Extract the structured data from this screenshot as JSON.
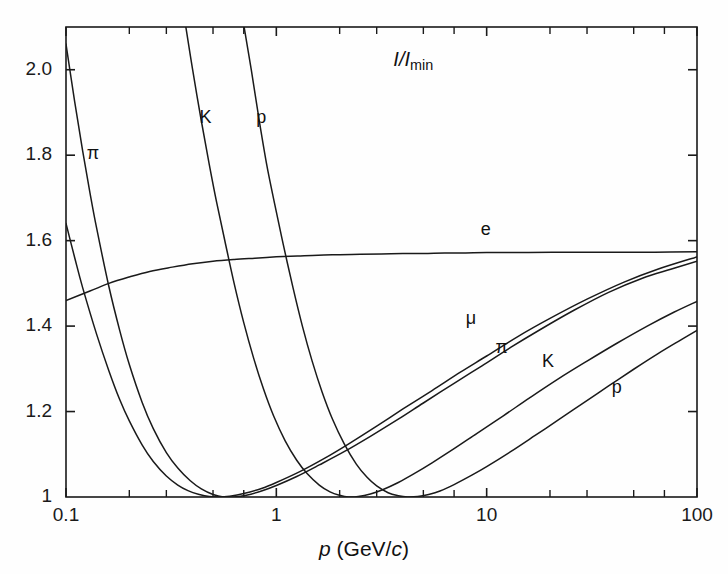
{
  "chart_data": {
    "type": "line",
    "title_parts": {
      "numerator": "I",
      "slash": "/",
      "denominator": "I",
      "subscript": "min"
    },
    "xlabel": "p (GeV/c)",
    "xlabel_parts": {
      "symbol": "p",
      "unit_open": " (GeV/",
      "unit_c": "c",
      "unit_close": ")"
    },
    "ylabel": "",
    "xscale": "log",
    "yscale": "linear",
    "xlim": [
      0.1,
      100
    ],
    "ylim": [
      1.0,
      2.1
    ],
    "grid": false,
    "legend": "inline-curve-labels",
    "xticks": [
      0.1,
      1,
      10,
      100
    ],
    "xtick_labels": [
      "0.1",
      "1",
      "10",
      "100"
    ],
    "yticks": [
      1,
      1.2,
      1.4,
      1.6,
      1.8,
      2.0
    ],
    "ytick_labels": [
      "1",
      "1.2",
      "1.4",
      "1.6",
      "1.8",
      "2.0"
    ],
    "minor_xticks": [
      0.2,
      0.3,
      0.5,
      0.7,
      2,
      3,
      5,
      7,
      20,
      30,
      50,
      70
    ],
    "series": [
      {
        "name": "e",
        "label": "e",
        "label_x": 10.0,
        "label_y": 1.6,
        "points": [
          [
            0.1,
            1.46
          ],
          [
            0.13,
            1.482
          ],
          [
            0.16,
            1.5
          ],
          [
            0.2,
            1.515
          ],
          [
            0.25,
            1.528
          ],
          [
            0.32,
            1.538
          ],
          [
            0.4,
            1.546
          ],
          [
            0.5,
            1.552
          ],
          [
            0.63,
            1.556
          ],
          [
            0.79,
            1.559
          ],
          [
            1.0,
            1.562
          ],
          [
            1.26,
            1.564
          ],
          [
            1.58,
            1.566
          ],
          [
            2.0,
            1.567
          ],
          [
            2.51,
            1.568
          ],
          [
            3.16,
            1.569
          ],
          [
            4.0,
            1.57
          ],
          [
            5.01,
            1.57
          ],
          [
            6.31,
            1.571
          ],
          [
            7.94,
            1.571
          ],
          [
            10.0,
            1.572
          ],
          [
            15.8,
            1.572
          ],
          [
            25.1,
            1.573
          ],
          [
            39.8,
            1.573
          ],
          [
            63.1,
            1.573
          ],
          [
            100.0,
            1.574
          ]
        ]
      },
      {
        "name": "mu",
        "label": "μ",
        "label_x": 8.5,
        "label_y": 1.395,
        "points": [
          [
            0.1,
            1.64
          ],
          [
            0.11,
            1.56
          ],
          [
            0.12,
            1.49
          ],
          [
            0.14,
            1.38
          ],
          [
            0.16,
            1.295
          ],
          [
            0.18,
            1.228
          ],
          [
            0.2,
            1.178
          ],
          [
            0.23,
            1.122
          ],
          [
            0.26,
            1.083
          ],
          [
            0.3,
            1.049
          ],
          [
            0.34,
            1.028
          ],
          [
            0.38,
            1.015
          ],
          [
            0.43,
            1.006
          ],
          [
            0.48,
            1.001
          ],
          [
            0.53,
            1.0
          ],
          [
            0.6,
            1.002
          ],
          [
            0.7,
            1.008
          ],
          [
            0.85,
            1.02
          ],
          [
            1.0,
            1.034
          ],
          [
            1.3,
            1.06
          ],
          [
            1.7,
            1.091
          ],
          [
            2.2,
            1.124
          ],
          [
            3.0,
            1.166
          ],
          [
            4.0,
            1.206
          ],
          [
            5.5,
            1.249
          ],
          [
            7.5,
            1.292
          ],
          [
            10.0,
            1.33
          ],
          [
            14.0,
            1.375
          ],
          [
            20.0,
            1.418
          ],
          [
            30.0,
            1.463
          ],
          [
            45.0,
            1.503
          ],
          [
            65.0,
            1.533
          ],
          [
            100.0,
            1.562
          ]
        ]
      },
      {
        "name": "pi",
        "label": "π",
        "label_x": 11.5,
        "label_y": 1.355,
        "label2_x": 0.12,
        "label2_y": 1.8,
        "points": [
          [
            0.1,
            2.06
          ],
          [
            0.11,
            1.925
          ],
          [
            0.12,
            1.81
          ],
          [
            0.13,
            1.712
          ],
          [
            0.14,
            1.628
          ],
          [
            0.16,
            1.492
          ],
          [
            0.18,
            1.39
          ],
          [
            0.2,
            1.31
          ],
          [
            0.23,
            1.222
          ],
          [
            0.26,
            1.16
          ],
          [
            0.3,
            1.104
          ],
          [
            0.34,
            1.068
          ],
          [
            0.39,
            1.038
          ],
          [
            0.44,
            1.019
          ],
          [
            0.5,
            1.006
          ],
          [
            0.56,
            1.0
          ],
          [
            0.63,
            1.0
          ],
          [
            0.72,
            1.004
          ],
          [
            0.85,
            1.014
          ],
          [
            1.0,
            1.027
          ],
          [
            1.25,
            1.048
          ],
          [
            1.6,
            1.075
          ],
          [
            2.1,
            1.106
          ],
          [
            2.8,
            1.142
          ],
          [
            3.8,
            1.182
          ],
          [
            5.0,
            1.22
          ],
          [
            7.0,
            1.266
          ],
          [
            9.5,
            1.307
          ],
          [
            13.0,
            1.35
          ],
          [
            18.0,
            1.392
          ],
          [
            26.0,
            1.437
          ],
          [
            38.0,
            1.479
          ],
          [
            55.0,
            1.512
          ],
          [
            75.0,
            1.533
          ],
          [
            100.0,
            1.552
          ]
        ]
      },
      {
        "name": "K",
        "label": "K",
        "label_x": 20.0,
        "label_y": 1.295,
        "label2_x": 0.45,
        "label2_y": 1.88,
        "points": [
          [
            0.37,
            2.105
          ],
          [
            0.4,
            2.0
          ],
          [
            0.44,
            1.88
          ],
          [
            0.48,
            1.778
          ],
          [
            0.52,
            1.69
          ],
          [
            0.57,
            1.598
          ],
          [
            0.63,
            1.5
          ],
          [
            0.7,
            1.408
          ],
          [
            0.78,
            1.325
          ],
          [
            0.87,
            1.252
          ],
          [
            0.97,
            1.19
          ],
          [
            1.1,
            1.132
          ],
          [
            1.25,
            1.086
          ],
          [
            1.4,
            1.055
          ],
          [
            1.6,
            1.028
          ],
          [
            1.8,
            1.012
          ],
          [
            2.0,
            1.004
          ],
          [
            2.2,
            1.0
          ],
          [
            2.45,
            1.001
          ],
          [
            2.8,
            1.007
          ],
          [
            3.2,
            1.017
          ],
          [
            3.8,
            1.034
          ],
          [
            4.5,
            1.054
          ],
          [
            5.5,
            1.08
          ],
          [
            7.0,
            1.113
          ],
          [
            9.0,
            1.149
          ],
          [
            12.0,
            1.19
          ],
          [
            16.0,
            1.232
          ],
          [
            22.0,
            1.277
          ],
          [
            30.0,
            1.318
          ],
          [
            42.0,
            1.361
          ],
          [
            58.0,
            1.4
          ],
          [
            78.0,
            1.433
          ],
          [
            100.0,
            1.458
          ]
        ]
      },
      {
        "name": "p",
        "label": "p",
        "label_x": 42.0,
        "label_y": 1.235,
        "label2_x": 0.82,
        "label2_y": 1.88,
        "points": [
          [
            0.7,
            2.105
          ],
          [
            0.76,
            2.0
          ],
          [
            0.83,
            1.88
          ],
          [
            0.9,
            1.778
          ],
          [
            0.98,
            1.688
          ],
          [
            1.08,
            1.59
          ],
          [
            1.2,
            1.49
          ],
          [
            1.33,
            1.4
          ],
          [
            1.48,
            1.318
          ],
          [
            1.65,
            1.246
          ],
          [
            1.85,
            1.182
          ],
          [
            2.1,
            1.125
          ],
          [
            2.4,
            1.077
          ],
          [
            2.7,
            1.046
          ],
          [
            3.0,
            1.026
          ],
          [
            3.4,
            1.01
          ],
          [
            3.8,
            1.003
          ],
          [
            4.2,
            1.0
          ],
          [
            4.7,
            1.001
          ],
          [
            5.3,
            1.006
          ],
          [
            6.0,
            1.014
          ],
          [
            7.0,
            1.029
          ],
          [
            8.5,
            1.051
          ],
          [
            10.0,
            1.071
          ],
          [
            13.0,
            1.106
          ],
          [
            17.0,
            1.144
          ],
          [
            22.0,
            1.181
          ],
          [
            29.0,
            1.221
          ],
          [
            38.0,
            1.26
          ],
          [
            50.0,
            1.299
          ],
          [
            65.0,
            1.335
          ],
          [
            82.0,
            1.365
          ],
          [
            100.0,
            1.39
          ]
        ]
      }
    ]
  },
  "axes": {
    "x_tick_labels": [
      "0.1",
      "1",
      "10",
      "100"
    ],
    "y_tick_labels": [
      "1",
      "1.2",
      "1.4",
      "1.6",
      "1.8",
      "2.0"
    ],
    "x_title_symbol": "p",
    "x_title_unit_open": " (GeV/",
    "x_title_unit_c": "c",
    "x_title_unit_close": ")",
    "title_num": "I",
    "title_slash": "/",
    "title_den": "I",
    "title_sub": "min"
  },
  "colors": {
    "axis": "#1a1a1a",
    "curve": "#1a1a1a",
    "background": "#fefefe",
    "text": "#111111"
  }
}
